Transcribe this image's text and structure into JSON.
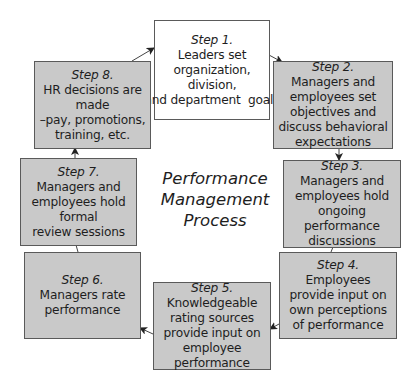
{
  "diagram": {
    "title_lines": [
      "Performance",
      "Management",
      "Process"
    ],
    "colors": {
      "box_fill": "#c9c9c9",
      "first_box_fill": "#ffffff",
      "border": "#5a5a5a",
      "arrow": "#222222"
    },
    "steps": [
      {
        "label": "Step 1.",
        "lines": [
          "Leaders set",
          "organization, division,",
          "and department  goals"
        ]
      },
      {
        "label": "Step 2.",
        "lines": [
          "Managers and",
          "employees set",
          "objectives and",
          "discuss behavioral",
          "expectations"
        ]
      },
      {
        "label": "Step 3.",
        "lines": [
          "Managers and",
          "employees hold",
          "ongoing performance",
          "discussions"
        ]
      },
      {
        "label": "Step 4.",
        "lines": [
          "Employees",
          "provide input on",
          "own perceptions",
          "of performance"
        ]
      },
      {
        "label": "Step 5.",
        "lines": [
          "Knowledgeable",
          "rating sources",
          "provide input on",
          "employee",
          "performance"
        ]
      },
      {
        "label": "Step 6.",
        "lines": [
          "Managers rate",
          "performance"
        ]
      },
      {
        "label": "Step 7.",
        "lines": [
          "Managers and",
          "employees hold formal",
          "review sessions"
        ]
      },
      {
        "label": "Step 8.",
        "lines": [
          "HR decisions are made",
          "–pay, promotions,",
          "training, etc."
        ]
      }
    ],
    "flow": [
      "Step 1 -> Step 2",
      "Step 2 -> Step 3",
      "Step 3 -> Step 4",
      "Step 4 -> Step 5",
      "Step 5 -> Step 6",
      "Step 6 -> Step 7",
      "Step 7 -> Step 8",
      "Step 8 -> Step 1"
    ]
  }
}
